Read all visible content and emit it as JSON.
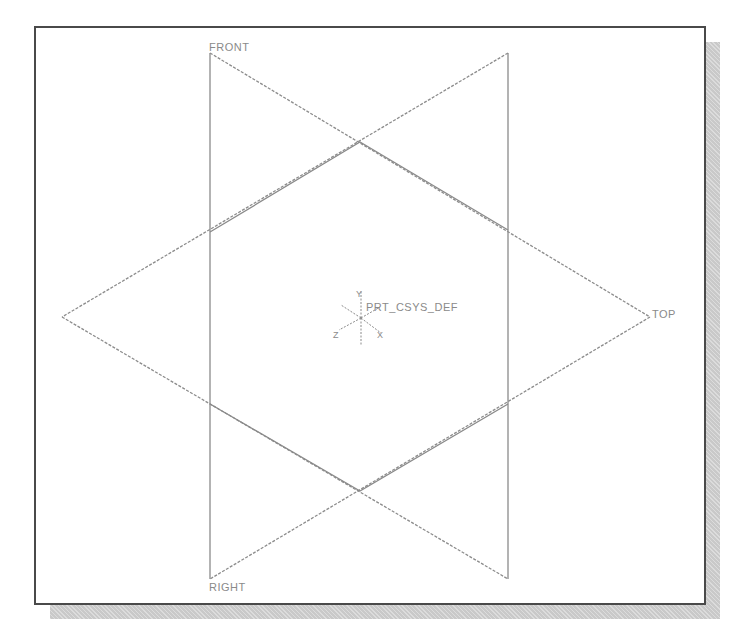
{
  "viewport": {
    "background": "#ffffff",
    "frame_border_color": "#4a4a4a",
    "shadow_color": "#c9c9c9",
    "datum_color": "#8a8a8a"
  },
  "datum_planes": [
    {
      "name": "FRONT",
      "label": "FRONT"
    },
    {
      "name": "RIGHT",
      "label": "RIGHT"
    },
    {
      "name": "TOP",
      "label": "TOP"
    }
  ],
  "coordinate_system": {
    "name": "PRT_CSYS_DEF",
    "label": "PRT_CSYS_DEF",
    "axes": {
      "x": "X",
      "y": "Y",
      "z": "Z"
    }
  }
}
